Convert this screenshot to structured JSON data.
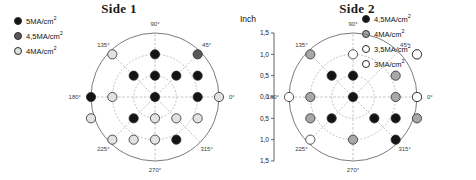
{
  "figure": {
    "panels": [
      {
        "id": "side1",
        "title": "Side 1",
        "legend": [
          {
            "label": "5MA/cm",
            "sup": "2",
            "color": "#141414"
          },
          {
            "label": "4,5MA/cm",
            "sup": "2",
            "color": "#5a5a5a"
          },
          {
            "label": "4MA/cm",
            "sup": "2",
            "color": "#e2e2e2"
          }
        ]
      },
      {
        "id": "side2",
        "title": "Side 2",
        "legend": [
          {
            "label": "4,5MA/cm",
            "sup": "2",
            "color": "#141414"
          },
          {
            "label": "4MA/cm",
            "sup": "2",
            "color": "#a8a8a8"
          },
          {
            "label": "3,5MA/cm",
            "sup": "2",
            "color": "#ffffff"
          },
          {
            "label": "3MA/cm",
            "sup": "2",
            "color": "#ffffff"
          }
        ]
      }
    ],
    "axis": {
      "unit": "Inch",
      "tick_labels": [
        "1,5",
        "1,0",
        "0,5",
        "0,0",
        "0,5",
        "1,0",
        "1,5"
      ]
    },
    "angle_labels": [
      "0",
      "45",
      "90",
      "135",
      "180",
      "225",
      "270",
      "315"
    ],
    "degree_symbol": "°"
  },
  "chart_data": {
    "type": "scatter",
    "xlabel": "",
    "ylabel": "Inch",
    "xlim": [
      -1.5,
      1.5
    ],
    "ylim": [
      -1.5,
      1.5
    ],
    "grid": true,
    "coordinate_system": "polar",
    "radial_ticks": [
      0.5,
      1.0,
      1.5
    ],
    "angular_ticks_deg": [
      0,
      45,
      90,
      135,
      180,
      225,
      270,
      315
    ],
    "legend_position": "outside-top",
    "panels": [
      {
        "name": "Side 1",
        "series": [
          {
            "name": "5MA/cm2",
            "color": "#141414",
            "points": [
              [
                0,
                1
              ],
              [
                -0.5,
                0.5
              ],
              [
                0,
                0.5
              ],
              [
                0.5,
                0.5
              ],
              [
                1,
                0.5
              ],
              [
                0,
                0
              ],
              [
                1,
                0
              ],
              [
                -1.5,
                0
              ],
              [
                -0.5,
                -0.5
              ],
              [
                0.5,
                -1
              ]
            ]
          },
          {
            "name": "4,5MA/cm2",
            "color": "#5a5a5a",
            "points": [
              [
                1,
                1
              ]
            ]
          },
          {
            "name": "4MA/cm2",
            "color": "#e2e2e2",
            "points": [
              [
                -1,
                1
              ],
              [
                -1,
                0
              ],
              [
                1.5,
                0
              ],
              [
                0,
                -0.5
              ],
              [
                0.5,
                -0.5
              ],
              [
                -1,
                -1
              ],
              [
                -0.5,
                -1
              ],
              [
                0,
                -1
              ],
              [
                1,
                -0.5
              ],
              [
                -1.5,
                -0.5
              ]
            ]
          }
        ]
      },
      {
        "name": "Side 2",
        "series": [
          {
            "name": "4,5MA/cm2",
            "color": "#141414",
            "points": [
              [
                0,
                0.5
              ],
              [
                -0.5,
                0.5
              ],
              [
                0,
                0
              ],
              [
                0.5,
                -0.5
              ],
              [
                -0.5,
                -0.5
              ],
              [
                1,
                -1
              ],
              [
                1,
                -0.5
              ]
            ]
          },
          {
            "name": "4MA/cm2",
            "color": "#a8a8a8",
            "points": [
              [
                -1,
                1
              ],
              [
                1,
                0.5
              ],
              [
                -1,
                0
              ],
              [
                1,
                0
              ],
              [
                -1,
                -0.5
              ],
              [
                0,
                -1
              ],
              [
                1.5,
                -0.5
              ],
              [
                1.5,
                0
              ],
              [
                1.5,
                1
              ]
            ]
          },
          {
            "name": "3,5MA/cm2",
            "color": "#ffffff",
            "points": [
              [
                0,
                1
              ],
              [
                1.5,
                1
              ],
              [
                -1.5,
                0
              ],
              [
                -1,
                -1
              ]
            ]
          },
          {
            "name": "3MA/cm2",
            "color": "#ffffff",
            "points": [
              [
                1.5,
                0
              ]
            ]
          }
        ]
      }
    ]
  }
}
